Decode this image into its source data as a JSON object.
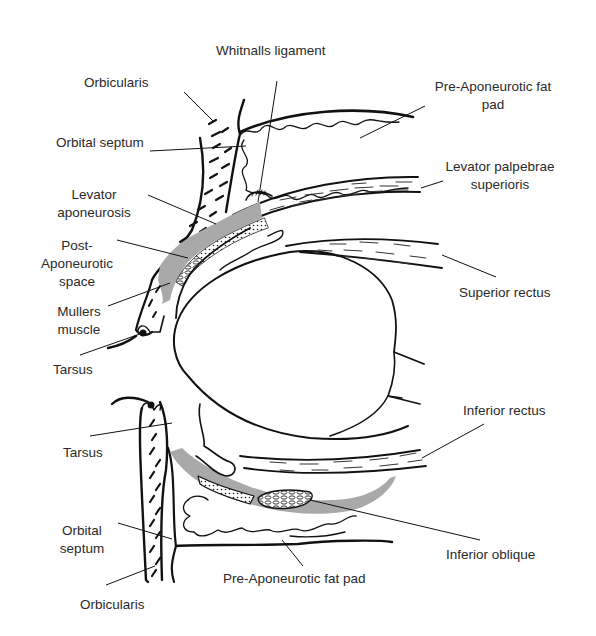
{
  "diagram": {
    "colors": {
      "ink": "#111111",
      "aponeurosis_gray": "#a9a9a9",
      "label_text": "#2a2a2a",
      "background": "#ffffff"
    },
    "upper_labels": {
      "whitnalls": "Whitnalls ligament",
      "orbicularis": "Orbicularis",
      "orbital_septum": "Orbital septum",
      "pre_aponeurotic_fat_line1": "Pre-Aponeurotic fat",
      "pre_aponeurotic_fat_line2": "pad",
      "levator_palpebrae_line1": "Levator palpebrae",
      "levator_palpebrae_line2": "superioris",
      "levator_aponeurosis_line1": "Levator",
      "levator_aponeurosis_line2": "aponeurosis",
      "post_aponeurotic_line1": "Post-",
      "post_aponeurotic_line2": "Aponeurotic",
      "post_aponeurotic_line3": "space",
      "superior_rectus": "Superior rectus",
      "mullers_line1": "Mullers",
      "mullers_line2": "muscle",
      "tarsus": "Tarsus"
    },
    "lower_labels": {
      "tarsus": "Tarsus",
      "inferior_rectus": "Inferior rectus",
      "orbital_septum_line1": "Orbital",
      "orbital_septum_line2": "septum",
      "inferior_oblique": "Inferior oblique",
      "pre_aponeurotic_fat": "Pre-Aponeurotic fat pad",
      "orbicularis": "Orbicularis"
    }
  }
}
